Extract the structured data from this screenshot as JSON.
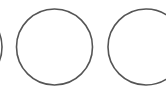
{
  "canvas": {
    "width": 166,
    "height": 90,
    "background": "#ffffff"
  },
  "stroke": {
    "color": "#555555",
    "width": 1.6
  },
  "circles": [
    {
      "name": "left-partial",
      "cx": -36,
      "cy": 47,
      "r": 38
    },
    {
      "name": "middle",
      "cx": 54.5,
      "cy": 47,
      "r": 38
    },
    {
      "name": "right-partial",
      "cx": 146,
      "cy": 47,
      "r": 38
    }
  ]
}
